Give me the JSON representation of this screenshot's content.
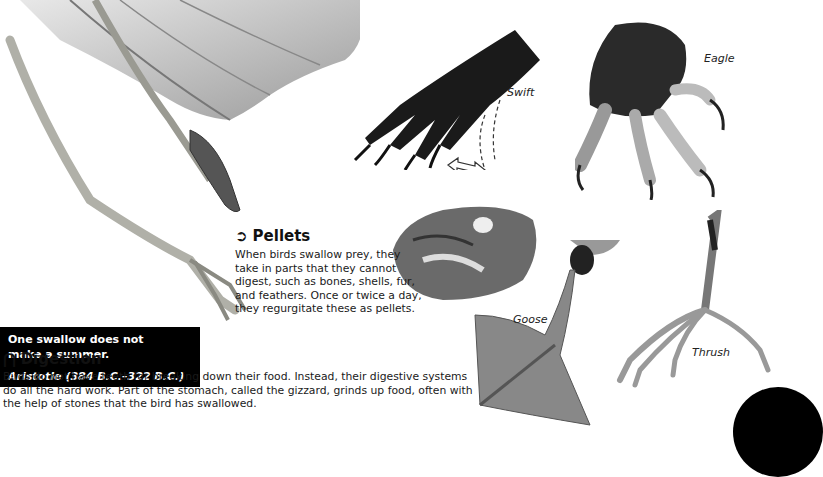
{
  "quote": {
    "text": "One swallow does not make a summer.",
    "author": "Aristotle (384 B.C.–322 B.C.)"
  },
  "pellets": {
    "icon": "arrow-right-circle-icon",
    "heading": "Pellets",
    "body": "When birds swallow prey, they take in parts that they cannot digest, such as bones, shells, fur, and feathers. Once or twice a day, they regurgitate these as pellets."
  },
  "digestion": {
    "icon": "info-drop-icon",
    "heading": "Digestion",
    "body": "Birds do not have teeth for breaking down their food. Instead, their digestive systems do all the hard work. Part of the stomach, called the gizzard, grinds up food, often with the help of stones that the bird has swallowed."
  },
  "labels": {
    "swift": "Swift",
    "eagle": "Eagle",
    "goose": "Goose",
    "thrush": "Thrush"
  }
}
